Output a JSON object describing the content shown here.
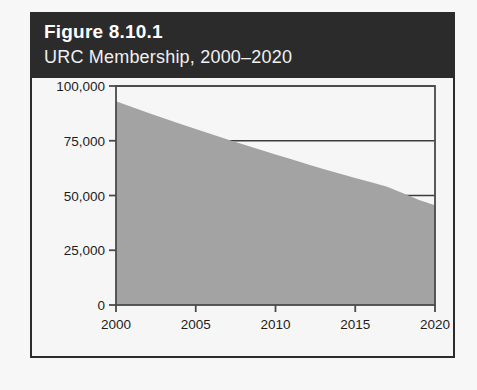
{
  "figure": {
    "number": "Figure 8.10.1",
    "subtitle": "URC Membership, 2000–2020"
  },
  "colors": {
    "header_background": "#2b2b2b",
    "header_text": "#ffffff",
    "card_border": "#2b2b2b",
    "page_background": "#f7f7f7",
    "plot_background": "#f6f6f6",
    "area_fill": "#a3a3a3",
    "axis_line": "#4a4a4a",
    "gridline": "#3c3c3c"
  },
  "chart_data": {
    "type": "area",
    "title": "URC Membership, 2000–2020",
    "xlabel": "",
    "ylabel": "",
    "xlim": [
      2000,
      2020
    ],
    "ylim": [
      0,
      100000
    ],
    "grid": true,
    "legend": false,
    "x_ticks": [
      "2000",
      "2005",
      "2010",
      "2015",
      "2020"
    ],
    "x_tick_values": [
      2000,
      2005,
      2010,
      2015,
      2020
    ],
    "y_ticks": [
      "0",
      "25,000",
      "50,000",
      "75,000",
      "100,000"
    ],
    "y_tick_values": [
      0,
      25000,
      50000,
      75000,
      100000
    ],
    "x": [
      2000,
      2001,
      2002,
      2003,
      2004,
      2005,
      2006,
      2007,
      2008,
      2009,
      2010,
      2011,
      2012,
      2013,
      2014,
      2015,
      2016,
      2017,
      2018,
      2019,
      2020
    ],
    "values": [
      93000,
      90400,
      87800,
      85300,
      82800,
      80400,
      78000,
      75600,
      73300,
      71000,
      68700,
      66500,
      64300,
      62100,
      60000,
      58000,
      56000,
      54000,
      51000,
      48000,
      45500
    ],
    "series": [
      {
        "name": "URC Membership",
        "values": [
          93000,
          90400,
          87800,
          85300,
          82800,
          80400,
          78000,
          75600,
          73300,
          71000,
          68700,
          66500,
          64300,
          62100,
          60000,
          58000,
          56000,
          54000,
          51000,
          48000,
          45500
        ]
      }
    ]
  }
}
